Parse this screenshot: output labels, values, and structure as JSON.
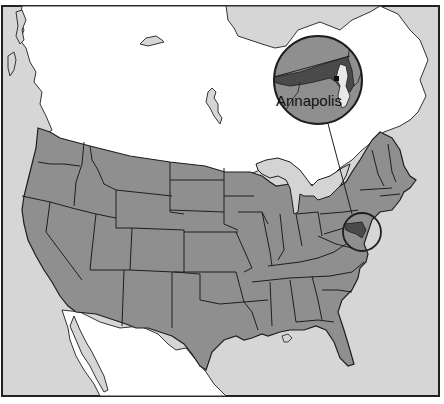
{
  "map": {
    "title": "",
    "region": "Contiguous United States",
    "highlighted_state": "Maryland",
    "callout": {
      "label": "Annapolis",
      "type": "inset-magnifier"
    },
    "colors": {
      "land_us": "#8f8f8f",
      "land_canada_mexico": "#ffffff",
      "water": "#d6d6d6",
      "great_lakes": "#d4d4d4",
      "maryland": "#4a4a4a",
      "capital_dot": "#111111",
      "borders": "#1e1e1e",
      "frame": "#222222"
    }
  }
}
